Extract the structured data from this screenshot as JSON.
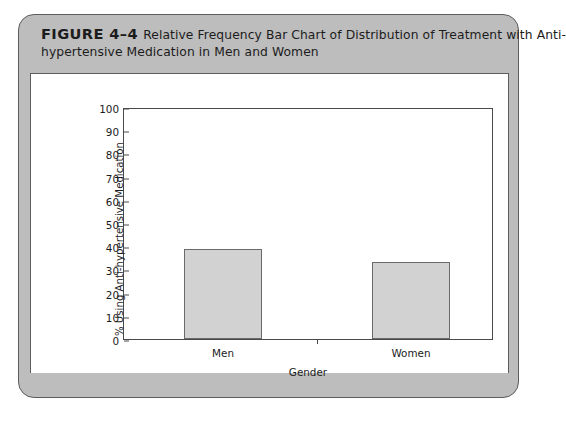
{
  "figure": {
    "number": "FIGURE 4–4",
    "caption_line1": "Relative Frequency Bar Chart of Distribution of Treatment with Anti-",
    "caption_line2": "hypertensive Medication in Men and Women",
    "panel_color": "#bdbdbd",
    "border_color": "#5d5d5d",
    "canvas_color": "#ffffff"
  },
  "chart_data": {
    "type": "bar",
    "categories": [
      "Men",
      "Women"
    ],
    "values": [
      39,
      33
    ],
    "xlabel": "Gender",
    "ylabel": "% Using Anti-hypertensive Medication",
    "ylim": [
      0,
      100
    ],
    "yticks": [
      0,
      10,
      20,
      30,
      40,
      50,
      60,
      70,
      80,
      90,
      100
    ],
    "ytick_labels": [
      "0",
      "10",
      "20",
      "30",
      "40",
      "50",
      "60",
      "70",
      "80",
      "90",
      "100"
    ],
    "grid": false,
    "legend": null,
    "bar_fill": "#d2d2d2",
    "bar_edge": "#6a6a6a",
    "axis_color": "#4a4a4a"
  }
}
